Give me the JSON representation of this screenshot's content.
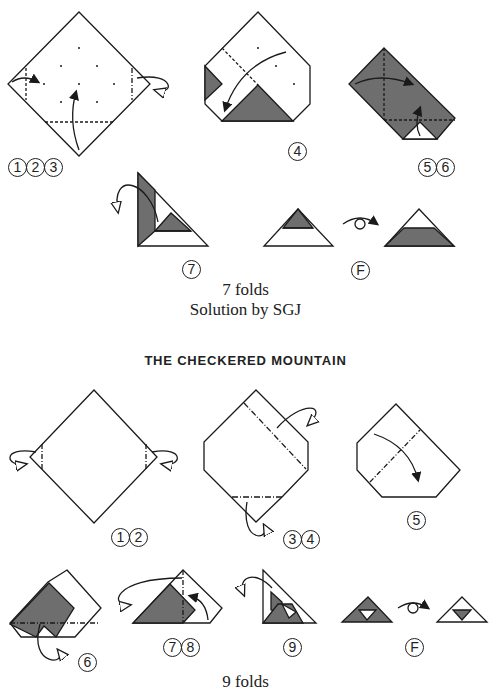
{
  "puzzle1": {
    "steps": [
      {
        "id": "s123",
        "label": [
          "1",
          "2",
          "3"
        ]
      },
      {
        "id": "s4",
        "label": [
          "4"
        ]
      },
      {
        "id": "s56",
        "label": [
          "5",
          "6"
        ]
      },
      {
        "id": "s7",
        "label": [
          "7"
        ]
      },
      {
        "id": "sF",
        "label": [
          "F"
        ]
      }
    ],
    "folds_text": "7 folds",
    "solution_text": "Solution by SGJ"
  },
  "puzzle2": {
    "title": "THE CHECKERED MOUNTAIN",
    "steps": [
      {
        "id": "s12",
        "label": [
          "1",
          "2"
        ]
      },
      {
        "id": "s34",
        "label": [
          "3",
          "4"
        ]
      },
      {
        "id": "s5",
        "label": [
          "5"
        ]
      },
      {
        "id": "s6",
        "label": [
          "6"
        ]
      },
      {
        "id": "s78",
        "label": [
          "7",
          "8"
        ]
      },
      {
        "id": "s9",
        "label": [
          "9"
        ]
      },
      {
        "id": "sF",
        "label": [
          "F"
        ]
      }
    ],
    "folds_text": "9 folds"
  },
  "colors": {
    "shade": "#6e6e6e",
    "line": "#1a1a1a",
    "paper": "#ffffff"
  }
}
